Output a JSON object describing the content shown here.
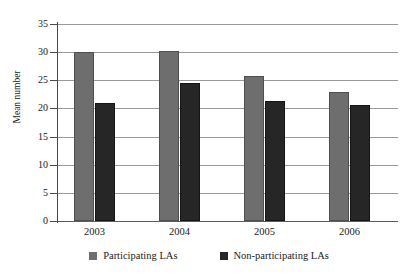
{
  "chart_data": {
    "type": "bar",
    "title": "",
    "xlabel": "",
    "ylabel": "Mean number",
    "categories": [
      "2003",
      "2004",
      "2005",
      "2006"
    ],
    "series": [
      {
        "name": "Participating LAs",
        "color": "#6e6e6e",
        "values": [
          30.0,
          30.2,
          25.7,
          22.9
        ]
      },
      {
        "name": "Non-participating LAs",
        "color": "#262626",
        "values": [
          20.9,
          24.5,
          21.3,
          20.6
        ]
      }
    ],
    "ylim": [
      0,
      35
    ],
    "ytick_step": 5,
    "yticks": [
      "0",
      "5",
      "10",
      "15",
      "20",
      "25",
      "30",
      "35"
    ],
    "grid": true,
    "legend_position": "bottom"
  },
  "legend": {
    "items": [
      {
        "label": "Participating LAs"
      },
      {
        "label": "Non-participating LAs"
      }
    ]
  }
}
